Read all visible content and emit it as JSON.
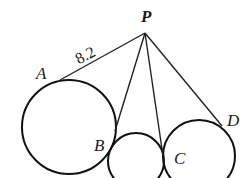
{
  "diagram": {
    "type": "geometry-tangents",
    "points": {
      "P": {
        "label": "P",
        "x": 145,
        "y": 33
      },
      "A": {
        "label": "A",
        "x": 60,
        "y": 80
      },
      "B": {
        "label": "B",
        "x": 111,
        "y": 148
      },
      "C": {
        "label": "C",
        "x": 163,
        "y": 162
      },
      "D": {
        "label": "D",
        "x": 220,
        "y": 125
      }
    },
    "circles": [
      {
        "name": "left-circle",
        "cx": 69,
        "cy": 127,
        "r": 47
      },
      {
        "name": "middle-circle",
        "cx": 136,
        "cy": 161,
        "r": 28
      },
      {
        "name": "right-circle",
        "cx": 199,
        "cy": 156,
        "r": 36
      }
    ],
    "segments": [
      {
        "from": "P",
        "to": "A",
        "length_label": "8.2"
      },
      {
        "from": "P",
        "to": "B"
      },
      {
        "from": "P",
        "to": "C"
      },
      {
        "from": "P",
        "to": "D"
      }
    ],
    "labels": {
      "P": "P",
      "A": "A",
      "B": "B",
      "C": "C",
      "D": "D",
      "PA_length": "8.2"
    }
  }
}
